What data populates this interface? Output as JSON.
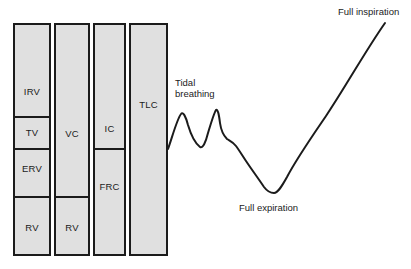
{
  "diagram": {
    "fill_color": "#e0e0e0",
    "line_color": "#1b1b1b",
    "background_color": "#ffffff",
    "columns": [
      {
        "segments": [
          "IRV",
          "TV",
          "ERV",
          "RV"
        ]
      },
      {
        "segments": [
          "VC",
          "RV"
        ]
      },
      {
        "segments": [
          "IC",
          "FRC"
        ]
      },
      {
        "segments": [
          "TLC"
        ]
      }
    ]
  },
  "trace": {
    "labels": {
      "tidal_line1": "Tidal",
      "tidal_line2": "breathing",
      "full_expiration": "Full expiration",
      "full_inspiration": "Full inspiration"
    },
    "line_color": "#1b1b1b",
    "path": "M168 149 C172 138 177 119 181 114 C183 111 186 117 188 125 C191 135 196 144 200 147 C203 149 206 141 208 133 C211 123 214 113 216 110 C218 109 219 115 220 123 C221 130 224 136 227 139 C230 141 233 142 236 146 C239 150 242 155 246 161 C252 170 258 178 264 187 C267 191 271 193 274 193 C278 193 282 186 287 177 C297 158 311 138 326 116 C346 86 366 50 385 23"
  }
}
